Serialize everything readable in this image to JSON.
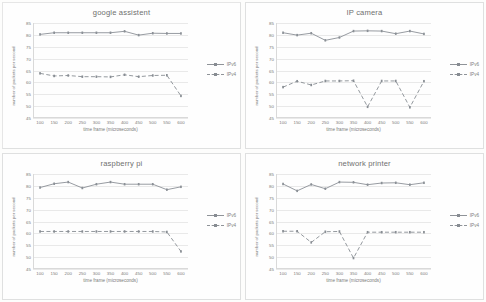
{
  "figure": {
    "series_colors": {
      "ipv6": "#8b9096",
      "ipv4": "#888d93"
    },
    "grid": true,
    "legend_position": "right"
  },
  "axis": {
    "xlabel": "time frame (microseconds)",
    "ylabel": "number of packets per second",
    "xticks": [
      "100",
      "150",
      "200",
      "250",
      "300",
      "350",
      "400",
      "450",
      "500",
      "550",
      "600"
    ],
    "yticks": [
      "85",
      "80",
      "75",
      "70",
      "65",
      "60",
      "55",
      "50",
      "45"
    ],
    "ylim": [
      45,
      85
    ],
    "legend": {
      "ipv6": "IPv6",
      "ipv4": "IPv4"
    }
  },
  "chart_data": [
    {
      "type": "line",
      "title": "google assistent",
      "xlabel": "time frame (microseconds)",
      "ylabel": "number of packets per second",
      "x": [
        100,
        150,
        200,
        250,
        300,
        350,
        400,
        450,
        500,
        550,
        600
      ],
      "xlim": [
        100,
        600
      ],
      "ylim": [
        45,
        85
      ],
      "grid": true,
      "legend_position": "right",
      "series": [
        {
          "name": "IPv6",
          "values": [
            80.2,
            80.9,
            80.9,
            80.9,
            80.9,
            80.9,
            81.5,
            79.9,
            80.7,
            80.6,
            80.6
          ]
        },
        {
          "name": "IPv4",
          "values": [
            63.8,
            62.7,
            62.9,
            62.4,
            62.4,
            62.3,
            63.2,
            62.4,
            62.9,
            63.0,
            54.3
          ]
        }
      ]
    },
    {
      "type": "line",
      "title": "IP camera",
      "xlabel": "time frame (microseconds)",
      "ylabel": "number of packets per second",
      "x": [
        100,
        150,
        200,
        250,
        300,
        350,
        400,
        450,
        500,
        550,
        600
      ],
      "xlim": [
        100,
        600
      ],
      "ylim": [
        45,
        85
      ],
      "grid": true,
      "legend_position": "right",
      "series": [
        {
          "name": "IPv6",
          "values": [
            80.9,
            79.9,
            80.7,
            77.7,
            78.9,
            81.6,
            81.7,
            81.6,
            80.5,
            81.6,
            80.4
          ]
        },
        {
          "name": "IPv4",
          "values": [
            58.0,
            60.5,
            58.9,
            60.6,
            60.6,
            60.7,
            49.7,
            60.6,
            60.6,
            49.5,
            60.5
          ]
        }
      ]
    },
    {
      "type": "line",
      "title": "raspberry pi",
      "xlabel": "time frame (microseconds)",
      "ylabel": "number of packets per second",
      "x": [
        100,
        150,
        200,
        250,
        300,
        350,
        400,
        450,
        500,
        550,
        600
      ],
      "xlim": [
        100,
        600
      ],
      "ylim": [
        45,
        85
      ],
      "grid": true,
      "legend_position": "right",
      "series": [
        {
          "name": "IPv6",
          "values": [
            79.3,
            80.9,
            81.6,
            79.1,
            80.7,
            81.6,
            80.7,
            80.7,
            80.7,
            78.4,
            79.6
          ]
        },
        {
          "name": "IPv4",
          "values": [
            60.8,
            60.8,
            60.8,
            60.8,
            60.8,
            60.8,
            60.8,
            60.8,
            60.8,
            60.6,
            52.4
          ]
        }
      ]
    },
    {
      "type": "line",
      "title": "network printer",
      "xlabel": "time frame (microseconds)",
      "ylabel": "number of packets per second",
      "x": [
        100,
        150,
        200,
        250,
        300,
        350,
        400,
        450,
        500,
        550,
        600
      ],
      "xlim": [
        100,
        600
      ],
      "ylim": [
        45,
        85
      ],
      "grid": true,
      "legend_position": "right",
      "series": [
        {
          "name": "IPv6",
          "values": [
            80.8,
            77.9,
            80.6,
            78.8,
            81.6,
            81.5,
            80.5,
            81.2,
            81.3,
            80.5,
            81.3
          ]
        },
        {
          "name": "IPv4",
          "values": [
            60.9,
            60.9,
            56.2,
            60.7,
            60.8,
            49.6,
            60.5,
            60.5,
            60.5,
            60.5,
            60.5
          ]
        }
      ]
    }
  ]
}
